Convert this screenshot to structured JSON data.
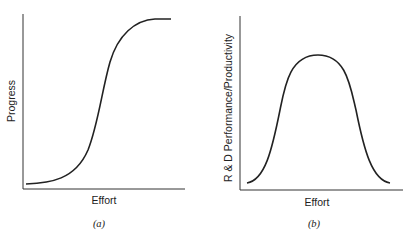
{
  "figure": {
    "panels": [
      {
        "id": "a",
        "caption": "(a)",
        "xlabel": "Effort",
        "ylabel": "Progress",
        "curve": "s-curve"
      },
      {
        "id": "b",
        "caption": "(b)",
        "xlabel": "Effort",
        "ylabel": "R & D Performance/Productivity",
        "curve": "bell-curve"
      }
    ],
    "line_color": "#222222"
  }
}
